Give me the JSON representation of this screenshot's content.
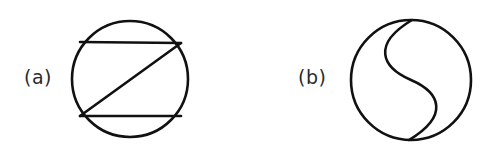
{
  "figure": {
    "background_color": "#ffffff",
    "ink_color": "#111111",
    "panels": [
      {
        "id": "a",
        "label": "(a)",
        "description": "circle with inscribed zigzag: upper horizontal chord, diagonal, lower horizontal chord",
        "circle": {
          "cx": 130,
          "cy": 79,
          "r": 58
        },
        "stroke_width": 2.6,
        "chords": [
          {
            "name": "upper-chord",
            "x1": 80,
            "y1": 42,
            "x2": 181,
            "y2": 43
          },
          {
            "name": "diagonal-chord",
            "x1": 181,
            "y1": 43,
            "x2": 80,
            "y2": 116
          },
          {
            "name": "lower-chord",
            "x1": 80,
            "y1": 116,
            "x2": 181,
            "y2": 116
          }
        ]
      },
      {
        "id": "b",
        "label": "(b)",
        "description": "circle divided into two congruent regions by an S shaped curve from top to bottom",
        "circle": {
          "cx": 411,
          "cy": 80,
          "r": 60
        },
        "stroke_width": 2.6,
        "s_curve": {
          "name": "s-divider",
          "start": {
            "x": 412,
            "y": 20
          },
          "end": {
            "x": 409,
            "y": 140
          },
          "control_1": {
            "x": 372,
            "y": 44
          },
          "control_2": {
            "x": 381,
            "y": 67
          },
          "mid": {
            "x": 411,
            "y": 80
          },
          "control_3": {
            "x": 441,
            "y": 93
          },
          "control_4": {
            "x": 449,
            "y": 116
          }
        }
      }
    ]
  }
}
